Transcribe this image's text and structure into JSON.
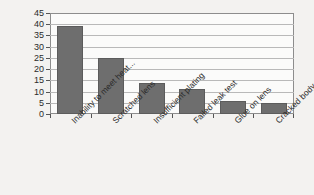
{
  "chart_data": {
    "type": "bar",
    "title": "",
    "xlabel": "",
    "ylabel": "",
    "categories": [
      "Inability to meet heat...",
      "Scratched lens",
      "Insufficient plating",
      "Failed leak test",
      "Glue on lens",
      "Cracked body"
    ],
    "values": [
      39,
      25,
      14,
      11,
      6,
      5
    ],
    "ylim": [
      0,
      45
    ],
    "ytick_labels": [
      "0",
      "5",
      "10",
      "15",
      "20",
      "25",
      "30",
      "35",
      "40",
      "45"
    ],
    "ytick_values": [
      0,
      5,
      10,
      15,
      20,
      25,
      30,
      35,
      40,
      45
    ],
    "grid": true,
    "legend": false,
    "colors": {
      "bar_fill": "#6e6e6e",
      "bar_edge": "#5c5c5c",
      "plot_background": "#fbfbfa",
      "page_background": "#f3f2f0",
      "gridline": "#b9b9b9",
      "axis": "#8d8d8d",
      "text": "#2b2b2b"
    }
  }
}
